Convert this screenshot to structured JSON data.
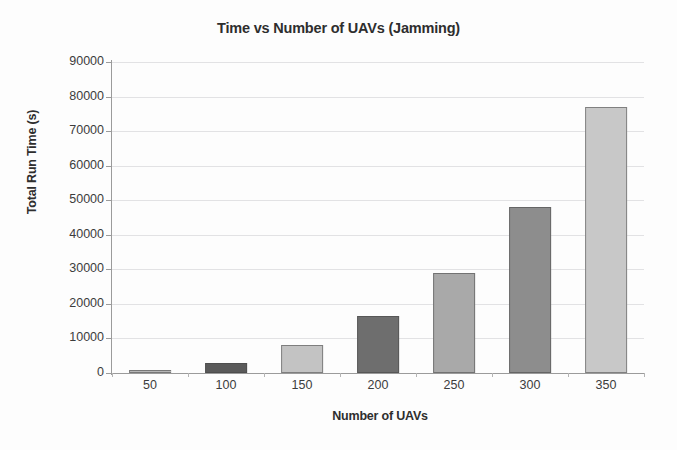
{
  "chart_data": {
    "type": "bar",
    "title": "Time vs Number of UAVs (Jamming)",
    "xlabel": "Number of UAVs",
    "ylabel": "Total Run Time (s)",
    "categories": [
      "50",
      "100",
      "150",
      "200",
      "250",
      "300",
      "350"
    ],
    "values": [
      800,
      3000,
      8000,
      16500,
      29000,
      48000,
      77000
    ],
    "ylim": [
      0,
      90000
    ],
    "ytick_labels": [
      "90000",
      "80000",
      "70000",
      "60000",
      "50000",
      "40000",
      "30000",
      "20000",
      "10000",
      "0"
    ],
    "ytick_values": [
      90000,
      80000,
      70000,
      60000,
      50000,
      40000,
      30000,
      20000,
      10000,
      0
    ],
    "grid": true,
    "legend": "none",
    "bar_colors": [
      "#b6b6b6",
      "#5a5a5a",
      "#c3c3c3",
      "#6e6e6e",
      "#a9a9a9",
      "#8d8d8d",
      "#c8c8c8"
    ],
    "grid_color": "#e2e2e4",
    "axis_color": "#9b9b9b",
    "text_color": "#3c3c3c",
    "background": "#fdfdfd"
  }
}
